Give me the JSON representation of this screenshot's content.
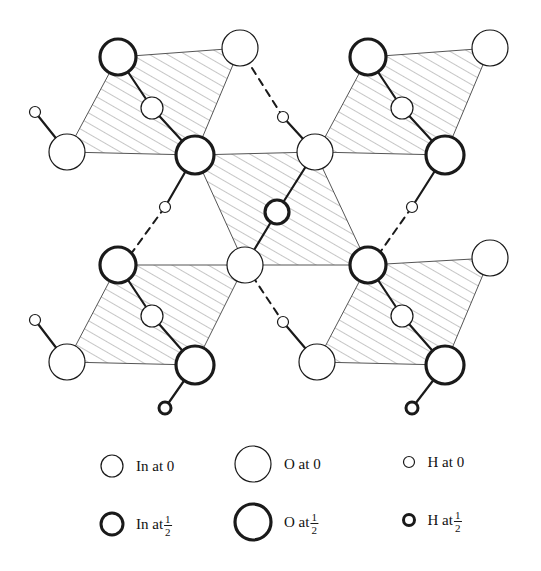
{
  "figure": {
    "title": "",
    "type": "crystal-structure-projection",
    "background": "#ffffff",
    "stroke_color": "#1a1a1a",
    "hatch_color": "#8d8d8d",
    "width": 541,
    "height": 571
  },
  "legend": {
    "entries": [
      {
        "id": "in-at-0",
        "symbol": "circle-thin-medium",
        "label": "In at 0",
        "element": "In",
        "height": "0",
        "radius": 11,
        "stroke_width": 1.2,
        "cx": 112,
        "cy": 466
      },
      {
        "id": "in-at-half",
        "symbol": "circle-bold-medium",
        "label": "In at ",
        "element": "In",
        "height": "1/2",
        "radius": 11,
        "stroke_width": 3.0,
        "cx": 112,
        "cy": 524,
        "numerator": "1",
        "denominator": "2"
      },
      {
        "id": "o-at-0",
        "symbol": "circle-thin-large",
        "label": "O at 0",
        "element": "O",
        "height": "0",
        "radius": 18,
        "stroke_width": 1.2,
        "cx": 253,
        "cy": 464
      },
      {
        "id": "o-at-half",
        "symbol": "circle-bold-large",
        "label": "O at ",
        "element": "O",
        "height": "1/2",
        "radius": 18,
        "stroke_width": 3.2,
        "cx": 253,
        "cy": 522,
        "numerator": "1",
        "denominator": "2"
      },
      {
        "id": "h-at-0",
        "symbol": "circle-thin-small",
        "label": "H at 0",
        "element": "H",
        "height": "0",
        "radius": 5.5,
        "stroke_width": 1.2,
        "cx": 409,
        "cy": 462
      },
      {
        "id": "h-at-half",
        "symbol": "circle-bold-small",
        "label": "H at ",
        "element": "H",
        "height": "1/2",
        "radius": 5.5,
        "stroke_width": 3.0,
        "cx": 409,
        "cy": 520,
        "numerator": "1",
        "denominator": "2"
      }
    ]
  },
  "structure": {
    "polygons": [
      {
        "id": "slab-top-left",
        "hatched": true,
        "points": "118,57 240,48 195,155 67,152"
      },
      {
        "id": "slab-top-right",
        "hatched": true,
        "points": "368,57 490,48 445,155 317,152"
      },
      {
        "id": "slab-center",
        "hatched": true,
        "points": "195,155 315,152 368,265 245,265"
      },
      {
        "id": "slab-bottom-left",
        "hatched": true,
        "points": "118,265 245,265 195,365 67,362"
      },
      {
        "id": "slab-bottom-right",
        "hatched": true,
        "points": "368,265 490,258 445,365 317,362"
      }
    ],
    "bonds": [
      {
        "id": "b1",
        "type": "solid",
        "x1": 118,
        "y1": 57,
        "x2": 152,
        "y2": 108
      },
      {
        "id": "b2",
        "type": "solid",
        "x1": 152,
        "y1": 108,
        "x2": 195,
        "y2": 155
      },
      {
        "id": "b3",
        "type": "solid",
        "x1": 35,
        "y1": 112,
        "x2": 67,
        "y2": 152
      },
      {
        "id": "b4",
        "type": "dashed",
        "x1": 252,
        "y1": 68,
        "x2": 283,
        "y2": 117
      },
      {
        "id": "b5",
        "type": "solid",
        "x1": 283,
        "y1": 117,
        "x2": 315,
        "y2": 152
      },
      {
        "id": "b6",
        "type": "solid",
        "x1": 368,
        "y1": 57,
        "x2": 402,
        "y2": 108
      },
      {
        "id": "b7",
        "type": "solid",
        "x1": 402,
        "y1": 108,
        "x2": 445,
        "y2": 155
      },
      {
        "id": "b8",
        "type": "solid",
        "x1": 315,
        "y1": 152,
        "x2": 277,
        "y2": 212
      },
      {
        "id": "b9",
        "type": "solid",
        "x1": 277,
        "y1": 212,
        "x2": 245,
        "y2": 265
      },
      {
        "id": "b10",
        "type": "solid",
        "x1": 195,
        "y1": 155,
        "x2": 165,
        "y2": 207
      },
      {
        "id": "b11",
        "type": "dashed",
        "x1": 165,
        "y1": 207,
        "x2": 128,
        "y2": 258
      },
      {
        "id": "b12",
        "type": "solid",
        "x1": 445,
        "y1": 155,
        "x2": 412,
        "y2": 207
      },
      {
        "id": "b13",
        "type": "dashed",
        "x1": 412,
        "y1": 207,
        "x2": 376,
        "y2": 258
      },
      {
        "id": "b14",
        "type": "solid",
        "x1": 118,
        "y1": 265,
        "x2": 152,
        "y2": 316
      },
      {
        "id": "b15",
        "type": "solid",
        "x1": 152,
        "y1": 316,
        "x2": 195,
        "y2": 365
      },
      {
        "id": "b16",
        "type": "solid",
        "x1": 35,
        "y1": 320,
        "x2": 67,
        "y2": 362
      },
      {
        "id": "b17",
        "type": "dashed",
        "x1": 245,
        "y1": 265,
        "x2": 283,
        "y2": 322
      },
      {
        "id": "b18",
        "type": "solid",
        "x1": 283,
        "y1": 322,
        "x2": 317,
        "y2": 362
      },
      {
        "id": "b19",
        "type": "solid",
        "x1": 368,
        "y1": 265,
        "x2": 402,
        "y2": 316
      },
      {
        "id": "b20",
        "type": "solid",
        "x1": 402,
        "y1": 316,
        "x2": 445,
        "y2": 365
      },
      {
        "id": "b21",
        "type": "solid",
        "x1": 195,
        "y1": 365,
        "x2": 165,
        "y2": 408
      },
      {
        "id": "b22",
        "type": "solid",
        "x1": 445,
        "y1": 365,
        "x2": 412,
        "y2": 408
      }
    ],
    "atoms": [
      {
        "id": "a1",
        "element": "O",
        "height": "1/2",
        "cx": 118,
        "cy": 57,
        "r": 18,
        "bold": true
      },
      {
        "id": "a2",
        "element": "O",
        "height": "0",
        "cx": 240,
        "cy": 48,
        "r": 18,
        "bold": false
      },
      {
        "id": "a3",
        "element": "In",
        "height": "0",
        "cx": 152,
        "cy": 108,
        "r": 11,
        "bold": false
      },
      {
        "id": "a4",
        "element": "O",
        "height": "0",
        "cx": 67,
        "cy": 152,
        "r": 18,
        "bold": false
      },
      {
        "id": "a5",
        "element": "H",
        "height": "0",
        "cx": 35,
        "cy": 112,
        "r": 5.5,
        "bold": false
      },
      {
        "id": "a6",
        "element": "O",
        "height": "1/2",
        "cx": 195,
        "cy": 155,
        "r": 19,
        "bold": true
      },
      {
        "id": "a7",
        "element": "H",
        "height": "0",
        "cx": 283,
        "cy": 117,
        "r": 5.5,
        "bold": false
      },
      {
        "id": "a8",
        "element": "O",
        "height": "0",
        "cx": 315,
        "cy": 152,
        "r": 18,
        "bold": false
      },
      {
        "id": "a9",
        "element": "O",
        "height": "1/2",
        "cx": 368,
        "cy": 57,
        "r": 18,
        "bold": true
      },
      {
        "id": "a10",
        "element": "O",
        "height": "0",
        "cx": 490,
        "cy": 48,
        "r": 18,
        "bold": false
      },
      {
        "id": "a11",
        "element": "In",
        "height": "0",
        "cx": 402,
        "cy": 108,
        "r": 11,
        "bold": false
      },
      {
        "id": "a12",
        "element": "O",
        "height": "1/2",
        "cx": 445,
        "cy": 155,
        "r": 19,
        "bold": true
      },
      {
        "id": "a13",
        "element": "In",
        "height": "1/2",
        "cx": 277,
        "cy": 212,
        "r": 12,
        "bold": true
      },
      {
        "id": "a14",
        "element": "H",
        "height": "0",
        "cx": 165,
        "cy": 207,
        "r": 5.5,
        "bold": false
      },
      {
        "id": "a15",
        "element": "H",
        "height": "0",
        "cx": 412,
        "cy": 207,
        "r": 5.5,
        "bold": false
      },
      {
        "id": "a16",
        "element": "O",
        "height": "0",
        "cx": 245,
        "cy": 265,
        "r": 18,
        "bold": false
      },
      {
        "id": "a17",
        "element": "O",
        "height": "1/2",
        "cx": 118,
        "cy": 265,
        "r": 18,
        "bold": true
      },
      {
        "id": "a18",
        "element": "In",
        "height": "0",
        "cx": 152,
        "cy": 316,
        "r": 11,
        "bold": false
      },
      {
        "id": "a19",
        "element": "O",
        "height": "0",
        "cx": 67,
        "cy": 362,
        "r": 18,
        "bold": false
      },
      {
        "id": "a20",
        "element": "H",
        "height": "0",
        "cx": 35,
        "cy": 320,
        "r": 5.5,
        "bold": false
      },
      {
        "id": "a21",
        "element": "O",
        "height": "1/2",
        "cx": 195,
        "cy": 365,
        "r": 19,
        "bold": true
      },
      {
        "id": "a22",
        "element": "H",
        "height": "1/2",
        "cx": 165,
        "cy": 408,
        "r": 6,
        "bold": true
      },
      {
        "id": "a23",
        "element": "O",
        "height": "1/2",
        "cx": 368,
        "cy": 265,
        "r": 18,
        "bold": true
      },
      {
        "id": "a24",
        "element": "H",
        "height": "0",
        "cx": 283,
        "cy": 322,
        "r": 5.5,
        "bold": false
      },
      {
        "id": "a25",
        "element": "O",
        "height": "0",
        "cx": 317,
        "cy": 362,
        "r": 18,
        "bold": false
      },
      {
        "id": "a26",
        "element": "In",
        "height": "0",
        "cx": 402,
        "cy": 316,
        "r": 11,
        "bold": false
      },
      {
        "id": "a27",
        "element": "O",
        "height": "0",
        "cx": 490,
        "cy": 258,
        "r": 18,
        "bold": false
      },
      {
        "id": "a28",
        "element": "O",
        "height": "1/2",
        "cx": 445,
        "cy": 365,
        "r": 19,
        "bold": true
      },
      {
        "id": "a29",
        "element": "H",
        "height": "1/2",
        "cx": 412,
        "cy": 408,
        "r": 6,
        "bold": true
      }
    ]
  }
}
